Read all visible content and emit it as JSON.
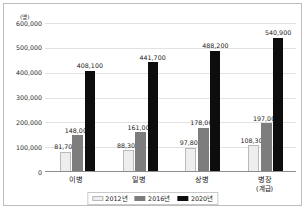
{
  "chart_data": {
    "type": "bar",
    "title": "",
    "xlabel": "(계급)",
    "ylabel": "(명)",
    "yunit": "(명)",
    "categories": [
      "이병",
      "일병",
      "상병",
      "병장"
    ],
    "ytick_labels": [
      "600,000",
      "500,000",
      "400,000",
      "300,000",
      "200,000",
      "100,000",
      "0"
    ],
    "ytick_values": [
      600000,
      500000,
      400000,
      300000,
      200000,
      100000,
      0
    ],
    "ylim": [
      0,
      600000
    ],
    "grid": true,
    "legend_position": "bottom",
    "series": [
      {
        "name": "2012년",
        "color": "#eeeeee",
        "values": [
          81700,
          88300,
          97800,
          108300
        ],
        "labels": [
          "81,700",
          "88,300",
          "97,800",
          "108,300"
        ]
      },
      {
        "name": "2016년",
        "color": "#7d7d7d",
        "values": [
          148000,
          161000,
          178000,
          197000
        ],
        "labels": [
          "148,000",
          "161,000",
          "178,000",
          "197,000"
        ]
      },
      {
        "name": "2020년",
        "color": "#0d0d0d",
        "values": [
          408100,
          441700,
          488200,
          540900
        ],
        "labels": [
          "408,100",
          "441,700",
          "488,200",
          "540,900"
        ]
      }
    ]
  }
}
